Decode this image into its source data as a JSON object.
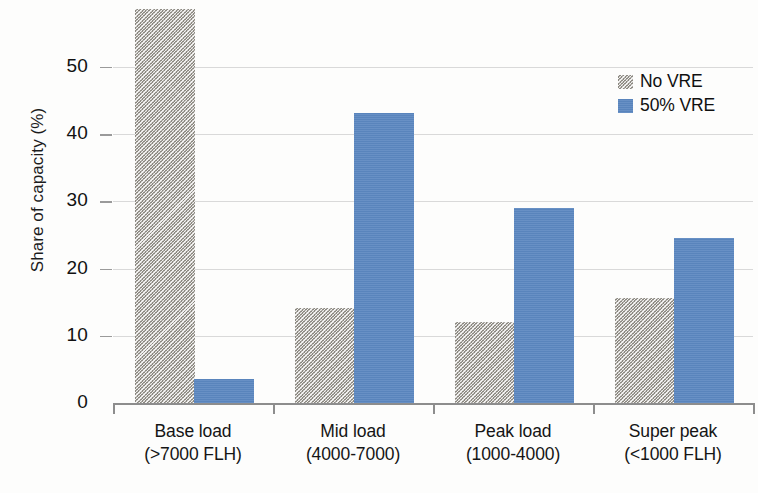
{
  "chart_data": {
    "type": "bar",
    "title": "",
    "xlabel": "",
    "ylabel": "Share of capacity (%)",
    "categories": [
      "Base load\n(>7000 FLH)",
      "Mid load\n(4000-7000)",
      "Peak load\n(1000-4000)",
      "Super peak\n(<1000 FLH)"
    ],
    "category_lines": [
      {
        "line1": "Base load",
        "line2": "(>7000 FLH)"
      },
      {
        "line1": "Mid load",
        "line2": "(4000-7000)"
      },
      {
        "line1": "Peak load",
        "line2": "(1000-4000)"
      },
      {
        "line1": "Super peak",
        "line2": "(<1000 FLH)"
      }
    ],
    "series": [
      {
        "name": "No VRE",
        "color": "#8d8a82",
        "pattern": "diagonal-hatch",
        "values": [
          58.6,
          14.2,
          12.1,
          15.6
        ]
      },
      {
        "name": "50% VRE",
        "color": "#5b87c0",
        "pattern": "solid",
        "values": [
          3.6,
          43.1,
          29.0,
          24.5
        ]
      }
    ],
    "yticks": [
      0,
      10,
      20,
      30,
      40,
      50
    ],
    "ytick_labels": [
      "0",
      "10",
      "20",
      "30",
      "40",
      "50"
    ],
    "ylim": [
      0,
      60
    ],
    "xlim_note": "4 categorical groups",
    "grid": "horizontal-only",
    "legend_position": "upper-right"
  },
  "legend": {
    "entries": [
      {
        "label": "No VRE"
      },
      {
        "label": "50% VRE"
      }
    ]
  },
  "axes": {
    "y_title": "Share of capacity (%)"
  }
}
